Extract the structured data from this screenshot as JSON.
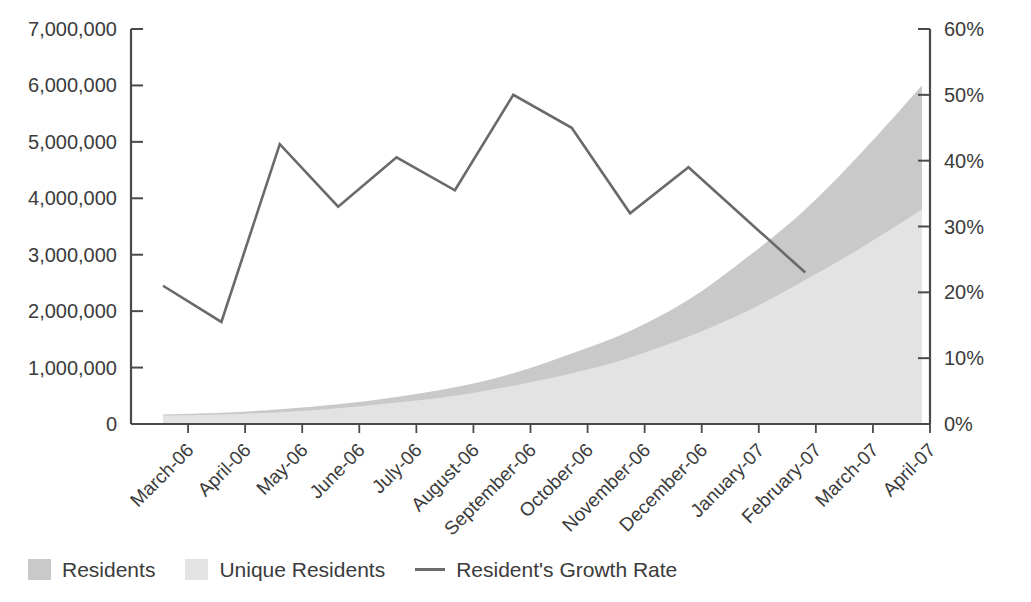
{
  "chart_data": {
    "type": "area",
    "title": "",
    "subtitle": "",
    "xlabel": "",
    "ylabel": "",
    "y2label": "",
    "grid": false,
    "legend_position": "bottom-left",
    "categories": [
      "March-06",
      "April-06",
      "May-06",
      "June-06",
      "July-06",
      "August-06",
      "September-06",
      "October-06",
      "November-06",
      "December-06",
      "January-07",
      "February-07",
      "March-07",
      "April-07"
    ],
    "ylim": [
      0,
      7000000
    ],
    "yticks": [
      0,
      1000000,
      2000000,
      3000000,
      4000000,
      5000000,
      6000000,
      7000000
    ],
    "ytick_labels": [
      "0",
      "1,000,000",
      "2,000,000",
      "3,000,000",
      "4,000,000",
      "5,000,000",
      "6,000,000",
      "7,000,000"
    ],
    "y2lim": [
      0,
      60
    ],
    "y2ticks": [
      0,
      10,
      20,
      30,
      40,
      50,
      60
    ],
    "y2tick_labels": [
      "0%",
      "10%",
      "20%",
      "30%",
      "40%",
      "50%",
      "60%"
    ],
    "series": [
      {
        "name": "Residents",
        "type": "area",
        "axis": "left",
        "color": "#c9c9c9",
        "values": [
          170000,
          200000,
          260000,
          350000,
          480000,
          650000,
          900000,
          1250000,
          1650000,
          2200000,
          2950000,
          3800000,
          4850000,
          6000000
        ]
      },
      {
        "name": "Unique Residents",
        "type": "area",
        "axis": "left",
        "color": "#e3e3e3",
        "values": [
          150000,
          170000,
          210000,
          280000,
          380000,
          500000,
          680000,
          900000,
          1180000,
          1550000,
          2000000,
          2550000,
          3150000,
          3800000
        ]
      },
      {
        "name": "Resident's Growth Rate",
        "type": "line",
        "axis": "right",
        "color": "#6a6a6a",
        "values": [
          21,
          15.5,
          42.5,
          33,
          40.5,
          35.5,
          50,
          45,
          32,
          39,
          31,
          23,
          null,
          null
        ]
      }
    ]
  },
  "legend": {
    "items": [
      {
        "label": "Residents",
        "marker": "area-swatch",
        "color": "#c9c9c9"
      },
      {
        "label": "Unique Residents",
        "marker": "area-swatch",
        "color": "#e3e3e3"
      },
      {
        "label": "Resident's Growth Rate",
        "marker": "line-swatch",
        "color": "#6a6a6a"
      }
    ]
  },
  "axes": {
    "left_axis_name": "Residents count",
    "right_axis_name": "Growth rate percent"
  }
}
